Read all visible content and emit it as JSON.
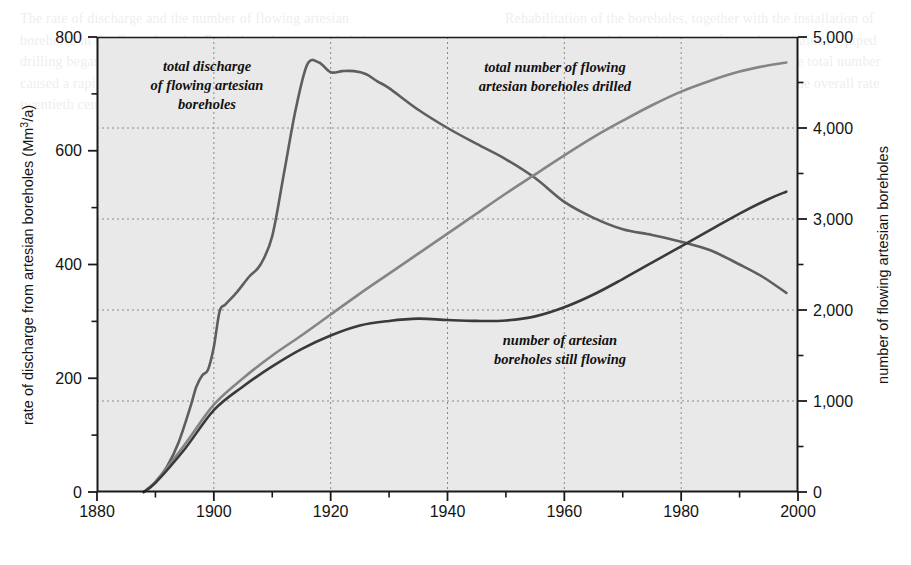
{
  "figure": {
    "plot_background": "#e9e9e9",
    "axis_color": "#1a1a1a",
    "grid_color": "#8a8a8a"
  },
  "axes": {
    "left": {
      "title": "rate of discharge from artesian boreholes (Mm",
      "title_sup": "3",
      "title_tail": "/a)",
      "title_full": "rate of discharge from artesian boreholes (Mm3/a)",
      "min": 0,
      "max": 800,
      "major_ticks": [
        0,
        200,
        400,
        600,
        800
      ],
      "minor_ticks": [
        100,
        300,
        500,
        700
      ],
      "tick_labels": [
        "0",
        "200",
        "400",
        "600",
        "800"
      ]
    },
    "right": {
      "title": "number of flowing artesian boreholes",
      "min": 0,
      "max": 5000,
      "major_ticks": [
        0,
        1000,
        2000,
        3000,
        4000,
        5000
      ],
      "minor_ticks": [
        500,
        1500,
        2500,
        3500,
        4500
      ],
      "tick_labels": [
        "0",
        "1,000",
        "2,000",
        "3,000",
        "4,000",
        "5,000"
      ]
    },
    "bottom": {
      "title": "",
      "min": 1880,
      "max": 2000,
      "major_ticks": [
        1880,
        1900,
        1920,
        1940,
        1960,
        1980,
        2000
      ],
      "minor_ticks": [
        1890,
        1910,
        1930,
        1950,
        1970,
        1990
      ],
      "tick_labels": [
        "1880",
        "1900",
        "1920",
        "1940",
        "1960",
        "1980",
        "2000"
      ]
    }
  },
  "gridlines": {
    "vertical_at": [
      1900,
      1920,
      1940,
      1960,
      1980
    ],
    "horizontal_right_scale_at": [
      1000,
      2000,
      3000,
      4000
    ],
    "style": "dotted"
  },
  "annotations": [
    {
      "id": "discharge",
      "lines": [
        "total discharge",
        "of flowing artesian",
        "boreholes"
      ],
      "x_px": 207,
      "y_px": 71
    },
    {
      "id": "drilled",
      "lines": [
        "total number of flowing",
        "artesian boreholes drilled"
      ],
      "x_px": 555,
      "y_px": 72
    },
    {
      "id": "still-flowing",
      "lines": [
        "number of artesian",
        "boreholes still flowing"
      ],
      "x_px": 560,
      "y_px": 345
    }
  ],
  "chart_data": {
    "type": "line",
    "title": "",
    "xlabel": "",
    "ylabel": "rate of discharge from artesian boreholes (Mm3/a)",
    "y2label": "number of flowing artesian boreholes",
    "xlim": [
      1880,
      2000
    ],
    "ylim": [
      0,
      800
    ],
    "y2lim": [
      0,
      5000
    ],
    "grid": true,
    "legend": "inline annotations",
    "series": [
      {
        "name": "total discharge of flowing artesian boreholes",
        "axis": "left",
        "units": "Mm3/a",
        "color": "#5e5e5e",
        "x": [
          1888,
          1890,
          1892,
          1894,
          1896,
          1897,
          1898,
          1899,
          1900,
          1901,
          1902,
          1904,
          1906,
          1908,
          1910,
          1912,
          1914,
          1916,
          1918,
          1920,
          1922,
          1924,
          1926,
          1928,
          1930,
          1935,
          1940,
          1945,
          1950,
          1955,
          1960,
          1965,
          1970,
          1975,
          1980,
          1985,
          1990,
          1994,
          1998
        ],
        "y": [
          0,
          18,
          45,
          88,
          150,
          185,
          205,
          215,
          255,
          318,
          330,
          352,
          378,
          400,
          450,
          560,
          672,
          752,
          755,
          738,
          740,
          740,
          735,
          722,
          710,
          672,
          640,
          612,
          585,
          552,
          510,
          482,
          462,
          452,
          440,
          425,
          400,
          378,
          350
        ]
      },
      {
        "name": "total number of flowing artesian boreholes drilled",
        "axis": "right",
        "units": "boreholes",
        "color": "#858585",
        "x": [
          1888,
          1890,
          1895,
          1900,
          1905,
          1910,
          1915,
          1920,
          1925,
          1930,
          1935,
          1940,
          1945,
          1950,
          1955,
          1960,
          1965,
          1970,
          1975,
          1980,
          1985,
          1990,
          1995,
          1998
        ],
        "y": [
          0,
          110,
          520,
          960,
          1250,
          1500,
          1720,
          1950,
          2180,
          2400,
          2620,
          2840,
          3060,
          3280,
          3490,
          3700,
          3900,
          4080,
          4250,
          4400,
          4520,
          4620,
          4690,
          4720
        ]
      },
      {
        "name": "number of artesian boreholes still flowing",
        "axis": "right",
        "units": "boreholes",
        "color": "#3a3a3a",
        "x": [
          1888,
          1890,
          1895,
          1900,
          1905,
          1910,
          1915,
          1920,
          1925,
          1930,
          1935,
          1940,
          1945,
          1950,
          1955,
          1960,
          1965,
          1970,
          1975,
          1980,
          1985,
          1990,
          1995,
          1998
        ],
        "y": [
          0,
          100,
          470,
          900,
          1160,
          1380,
          1570,
          1720,
          1830,
          1880,
          1905,
          1890,
          1880,
          1885,
          1930,
          2030,
          2170,
          2340,
          2520,
          2700,
          2880,
          3060,
          3220,
          3300
        ]
      }
    ],
    "notable_points": {
      "discharge_peak": {
        "year": 1916,
        "value": 755
      },
      "discharge_end": {
        "year": 1998,
        "value": 350
      },
      "drilled_end": {
        "year": 1998,
        "value": 4720
      },
      "still_flowing_end": {
        "year": 1998,
        "value": 3300
      },
      "crossing_drilled_discharge_year": 1958,
      "crossing_stillflowing_discharge_year": 1979,
      "series_start_year": 1888
    }
  },
  "bleed_text": {
    "left_column": "The rate of discharge and the number of flowing artesian boreholes in the Great Artesian Basin have been recorded since drilling began. Uncontrolled discharge from the early boreholes caused a rapid decline in pressure, and by the middle of the twentieth century many boreholes had ceased to flow altogether.",
    "right_column": "Rehabilitation of the boreholes, together with the installation of control valves and the replacement of open bore drains by piped reticulation, has reduced wastage considerably. The total number of boreholes drilled has continued to rise even as the overall rate of discharge has fallen."
  }
}
